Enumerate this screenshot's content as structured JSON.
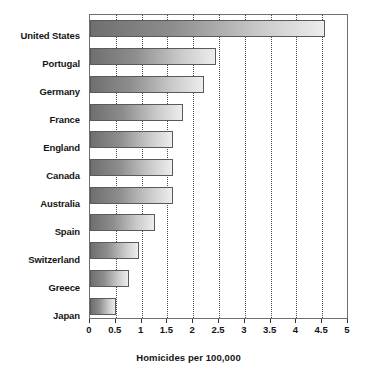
{
  "chart_data": {
    "type": "bar",
    "orientation": "horizontal",
    "title": "",
    "xlabel": "Homicides per 100,000",
    "ylabel": "",
    "xlim": [
      0,
      5
    ],
    "xticks": [
      "0",
      "0.5",
      "1",
      "1.5",
      "2",
      "2.5",
      "3",
      "3.5",
      "4",
      "4.5",
      "5"
    ],
    "xtick_values": [
      0,
      0.5,
      1,
      1.5,
      2,
      2.5,
      3,
      3.5,
      4,
      4.5,
      5
    ],
    "grid": "vertical-dotted",
    "legend": "none",
    "categories": [
      "United States",
      "Portugal",
      "Germany",
      "France",
      "England",
      "Canada",
      "Australia",
      "Spain",
      "Switzerland",
      "Greece",
      "Japan"
    ],
    "values": [
      4.55,
      2.45,
      2.2,
      1.8,
      1.6,
      1.6,
      1.6,
      1.25,
      0.95,
      0.75,
      0.5
    ],
    "bar_style": {
      "gradient_start": "#6f6f6f",
      "gradient_end": "#ededed",
      "border": "#5a5a5a"
    }
  }
}
